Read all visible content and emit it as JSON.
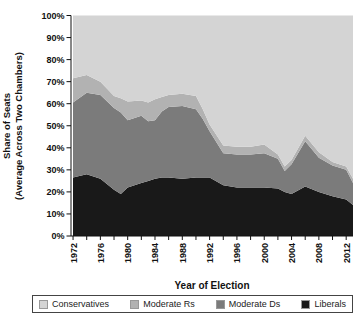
{
  "chart_data": {
    "type": "area",
    "stacked": true,
    "title": "",
    "xlabel": "Year of Election",
    "ylabel_line1": "Share of Seats",
    "ylabel_line2": "(Average Across Two Chambers)",
    "xlim": [
      1971.7,
      2013
    ],
    "ylim": [
      0,
      100
    ],
    "grid": false,
    "legend_position": "bottom",
    "x_tick_labels": [
      "1972",
      "1976",
      "1980",
      "1984",
      "1988",
      "1992",
      "1996",
      "2000",
      "2004",
      "2008",
      "2012"
    ],
    "x_minor_tick_step": 2,
    "x_minor_tick_range": [
      1972,
      2012
    ],
    "y_ticks": [
      "0%",
      "10%",
      "20%",
      "30%",
      "40%",
      "50%",
      "60%",
      "70%",
      "80%",
      "90%",
      "100%"
    ],
    "x": [
      1972,
      1974,
      1976,
      1978,
      1979,
      1980,
      1982,
      1983,
      1984,
      1985,
      1986,
      1988,
      1990,
      1991,
      1992,
      1994,
      1996,
      1998,
      2000,
      2002,
      2003,
      2004,
      2006,
      2008,
      2010,
      2012,
      2013
    ],
    "series": [
      {
        "name": "Liberals",
        "color": "#191919",
        "values": [
          26.5,
          28,
          26,
          21,
          19,
          22,
          24,
          25,
          26,
          26.5,
          26.5,
          26,
          26.5,
          26.5,
          26.5,
          23,
          22,
          22,
          22,
          21.5,
          20,
          19,
          22.5,
          20,
          18,
          16.5,
          14
        ]
      },
      {
        "name": "Moderate Ds",
        "color": "#7b7b7b",
        "values": [
          34,
          37,
          38,
          37,
          37,
          30.5,
          30.5,
          27,
          26.5,
          30,
          32,
          33,
          31,
          26.5,
          21,
          14.5,
          15,
          15,
          15.5,
          13.5,
          9.5,
          13.5,
          20.5,
          15.5,
          14,
          13.5,
          10
        ]
      },
      {
        "name": "Moderate Rs",
        "color": "#b2b2b2",
        "values": [
          11,
          8,
          6,
          5.5,
          6.5,
          8.5,
          7,
          8.5,
          9.5,
          6.5,
          5.5,
          5.5,
          6,
          4.5,
          3,
          3.5,
          3.5,
          3.5,
          4,
          2,
          2,
          2,
          2.5,
          2.5,
          1.5,
          1.5,
          2
        ]
      },
      {
        "name": "Conservatives",
        "color": "#d4d4d4",
        "values": [
          28.5,
          27,
          30,
          36.5,
          37.5,
          39,
          38.5,
          39.5,
          38,
          37,
          36,
          35.5,
          36.5,
          42.5,
          49.5,
          59,
          59.5,
          59.5,
          58.5,
          63,
          68.5,
          65.5,
          54.5,
          62,
          66.5,
          68.5,
          74
        ]
      }
    ]
  },
  "legend": {
    "items": [
      {
        "label": "Conservatives",
        "color": "#d4d4d4"
      },
      {
        "label": "Moderate Rs",
        "color": "#b2b2b2"
      },
      {
        "label": "Moderate Ds",
        "color": "#7b7b7b"
      },
      {
        "label": "Liberals",
        "color": "#191919"
      }
    ]
  }
}
